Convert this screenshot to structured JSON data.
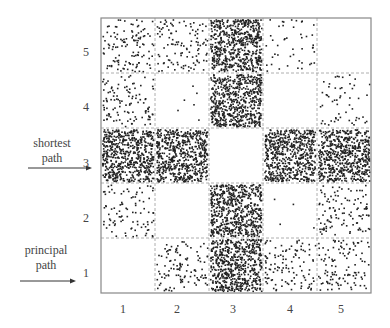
{
  "diagram": {
    "x_ticks": [
      "1",
      "2",
      "3",
      "4",
      "5"
    ],
    "y_ticks": [
      "5",
      "4",
      "3",
      "2",
      "1"
    ],
    "annotations": [
      {
        "id": "shortest",
        "line1": "shortest",
        "line2": "path",
        "points_to_row": "3"
      },
      {
        "id": "principal",
        "line1": "principal",
        "line2": "path",
        "points_to_row": "1"
      }
    ],
    "grid": {
      "cols": 5,
      "rows": 5
    },
    "densities": {
      "description": "rows listed top (5) to bottom (1); values are relative dot counts per cell",
      "row_5": [
        120,
        110,
        600,
        45,
        0
      ],
      "row_4": [
        110,
        6,
        600,
        0,
        55
      ],
      "row_3": [
        600,
        600,
        0,
        600,
        600
      ],
      "row_2": [
        90,
        0,
        600,
        4,
        110
      ],
      "row_1": [
        0,
        110,
        600,
        110,
        110
      ]
    },
    "colors": {
      "dot": "#222222",
      "border": "#888888",
      "dash": "#999999"
    }
  }
}
